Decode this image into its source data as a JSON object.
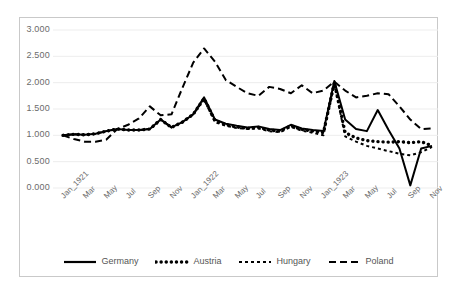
{
  "chart_data": {
    "type": "line",
    "title": "",
    "xlabel": "",
    "ylabel": "",
    "ylim": [
      0.0,
      3.0
    ],
    "ytick_labels": [
      "3.000",
      "2.500",
      "2.000",
      "1.500",
      "1.000",
      "0.500",
      "0.000"
    ],
    "ytick_values": [
      3.0,
      2.5,
      2.0,
      1.5,
      1.0,
      0.5,
      0.0
    ],
    "grid": true,
    "legend_position": "bottom",
    "x": [
      "Jan_1921",
      "Feb_1921",
      "Mar_1921",
      "Apr_1921",
      "May_1921",
      "Jun_1921",
      "Jul_1921",
      "Aug_1921",
      "Sep_1921",
      "Oct_1921",
      "Nov_1921",
      "Dec_1921",
      "Jan_1922",
      "Feb_1922",
      "Mar_1922",
      "Apr_1922",
      "May_1922",
      "Jun_1922",
      "Jul_1922",
      "Aug_1922",
      "Sep_1922",
      "Oct_1922",
      "Nov_1922",
      "Dec_1922",
      "Jan_1923",
      "Feb_1923",
      "Mar_1923",
      "Apr_1923",
      "May_1923",
      "Jun_1923",
      "Jul_1923",
      "Aug_1923",
      "Sep_1923",
      "Oct_1923",
      "Nov_1923"
    ],
    "xtick_labels": [
      "Jan_1921",
      "Mar",
      "May",
      "Jul",
      "Sep",
      "Nov",
      "Jan_1922",
      "Mar",
      "May",
      "Jul",
      "Sep",
      "Nov",
      "Jan_1923",
      "Mar",
      "May",
      "Jul",
      "Sep",
      "Nov"
    ],
    "series": [
      {
        "name": "Germany",
        "style": "solid",
        "color": "#000000",
        "values": [
          1.0,
          1.02,
          1.01,
          1.03,
          1.08,
          1.12,
          1.1,
          1.1,
          1.12,
          1.3,
          1.15,
          1.25,
          1.4,
          1.72,
          1.3,
          1.22,
          1.18,
          1.15,
          1.17,
          1.12,
          1.1,
          1.2,
          1.13,
          1.1,
          1.08,
          2.03,
          1.3,
          1.12,
          1.08,
          1.48,
          1.1,
          0.75,
          0.05,
          0.75,
          0.8
        ]
      },
      {
        "name": "Austria",
        "style": "dotted",
        "color": "#000000",
        "values": [
          1.0,
          1.02,
          1.01,
          1.03,
          1.08,
          1.12,
          1.1,
          1.1,
          1.12,
          1.3,
          1.15,
          1.25,
          1.4,
          1.7,
          1.28,
          1.2,
          1.16,
          1.13,
          1.15,
          1.1,
          1.08,
          1.18,
          1.11,
          1.08,
          1.05,
          2.0,
          1.05,
          0.95,
          0.9,
          0.88,
          0.87,
          0.88,
          0.86,
          0.88,
          0.8
        ]
      },
      {
        "name": "Hungary",
        "style": "smalldash",
        "color": "#000000",
        "values": [
          1.0,
          1.02,
          1.01,
          1.03,
          1.08,
          1.12,
          1.1,
          1.1,
          1.12,
          1.3,
          1.15,
          1.25,
          1.4,
          1.68,
          1.25,
          1.18,
          1.14,
          1.12,
          1.13,
          1.08,
          1.06,
          1.16,
          1.09,
          1.05,
          1.0,
          1.98,
          0.98,
          0.88,
          0.8,
          0.75,
          0.7,
          0.65,
          0.62,
          0.68,
          0.78
        ]
      },
      {
        "name": "Poland",
        "style": "longdash",
        "color": "#000000",
        "values": [
          1.0,
          0.93,
          0.88,
          0.88,
          0.92,
          1.12,
          1.2,
          1.32,
          1.55,
          1.38,
          1.4,
          1.9,
          2.38,
          2.65,
          2.4,
          2.05,
          1.92,
          1.8,
          1.75,
          1.92,
          1.88,
          1.8,
          1.95,
          1.8,
          1.85,
          2.02,
          1.85,
          1.72,
          1.75,
          1.8,
          1.78,
          1.55,
          1.3,
          1.12,
          1.13
        ]
      }
    ]
  }
}
